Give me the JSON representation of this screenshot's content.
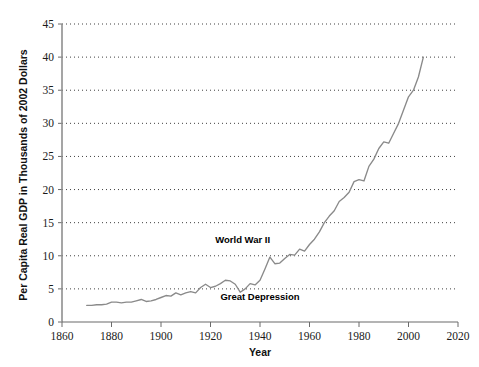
{
  "chart_data": {
    "type": "line",
    "title": "",
    "subtitle": "",
    "xlabel": "Year",
    "ylabel": "Per Capita Real GDP in Thousands of 2002 Dollars",
    "xlim": [
      1860,
      2020
    ],
    "ylim": [
      0,
      45
    ],
    "xticks": [
      1860,
      1880,
      1900,
      1920,
      1940,
      1960,
      1980,
      2000,
      2020
    ],
    "xtick_labels": [
      "1860",
      "1880",
      "1900",
      "1920",
      "1940",
      "1960",
      "1980",
      "2000",
      "2020"
    ],
    "yticks": [
      0,
      5,
      10,
      15,
      20,
      25,
      30,
      35,
      40,
      45
    ],
    "ytick_labels": [
      "0",
      "5",
      "10",
      "15",
      "20",
      "25",
      "30",
      "35",
      "40",
      "45"
    ],
    "grid": "horizontal-dotted",
    "legend": "none",
    "line_color": "#8a8a8a",
    "series": [
      {
        "name": "Per Capita Real GDP",
        "x": [
          1870,
          1872,
          1874,
          1876,
          1878,
          1880,
          1882,
          1884,
          1886,
          1888,
          1890,
          1892,
          1894,
          1896,
          1898,
          1900,
          1902,
          1904,
          1906,
          1908,
          1910,
          1912,
          1914,
          1916,
          1918,
          1920,
          1922,
          1924,
          1926,
          1928,
          1930,
          1932,
          1934,
          1936,
          1938,
          1940,
          1942,
          1944,
          1946,
          1948,
          1950,
          1952,
          1954,
          1956,
          1958,
          1960,
          1962,
          1964,
          1966,
          1968,
          1970,
          1972,
          1974,
          1976,
          1978,
          1980,
          1982,
          1984,
          1986,
          1988,
          1990,
          1992,
          1994,
          1996,
          1998,
          2000,
          2002,
          2004,
          2006
        ],
        "values": [
          2.5,
          2.5,
          2.6,
          2.6,
          2.7,
          3.0,
          3.0,
          2.9,
          3.0,
          3.0,
          3.2,
          3.4,
          3.1,
          3.2,
          3.4,
          3.7,
          4.0,
          3.9,
          4.4,
          4.1,
          4.4,
          4.6,
          4.4,
          5.2,
          5.7,
          5.2,
          5.4,
          5.8,
          6.3,
          6.2,
          5.7,
          4.5,
          5.0,
          5.8,
          5.6,
          6.3,
          8.0,
          9.8,
          8.8,
          8.9,
          9.6,
          10.2,
          10.1,
          11.0,
          10.7,
          11.7,
          12.5,
          13.6,
          15.0,
          16.0,
          16.8,
          18.2,
          18.8,
          19.6,
          21.2,
          21.5,
          21.3,
          23.5,
          24.6,
          26.2,
          27.2,
          27.0,
          28.5,
          30.0,
          32.0,
          34.0,
          35.0,
          37.0,
          40.0
        ]
      }
    ],
    "annotations": [
      {
        "text": "World War II",
        "x": 1933,
        "y": 12.0
      },
      {
        "text": "Great Depression",
        "x": 1940,
        "y": 3.3
      }
    ]
  },
  "axes": {
    "x_title": "Year",
    "y_title": "Per Capita Real GDP in Thousands of 2002 Dollars"
  }
}
